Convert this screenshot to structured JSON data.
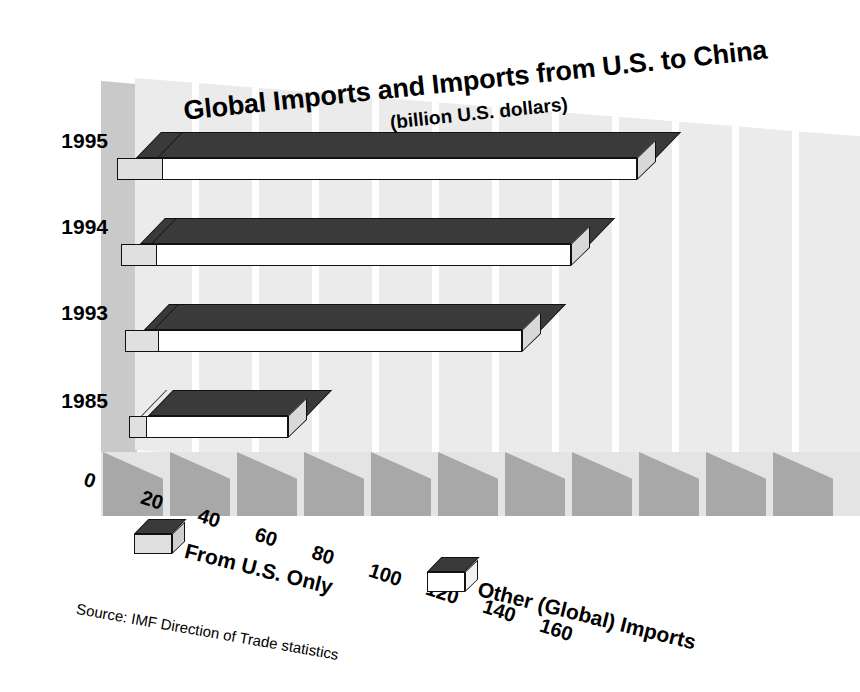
{
  "chart_data": {
    "type": "bar",
    "orientation": "horizontal",
    "stacked": true,
    "style": "3d",
    "title": "Global Imports and Imports from U.S. to China",
    "subtitle": "(billion U.S. dollars)",
    "xlabel": "",
    "ylabel": "",
    "xlim": [
      0,
      160
    ],
    "xticks": [
      0,
      20,
      40,
      60,
      80,
      100,
      120,
      140,
      160
    ],
    "xtick_labels": [
      "0",
      "20",
      "40",
      "60",
      "80",
      "100",
      "120",
      "140",
      "160"
    ],
    "grid": true,
    "legend_position": "bottom",
    "categories": [
      "1995",
      "1994",
      "1993",
      "1985"
    ],
    "series": [
      {
        "name": "From U.S. Only",
        "color": "#e0e0e0",
        "top_color": "#3a3a3a",
        "values": [
          11.7,
          9.3,
          8.8,
          4.7
        ]
      },
      {
        "name": "Other (Global) Imports",
        "color": "#ffffff",
        "top_color": "#3a3a3a",
        "values": [
          120.3,
          106.7,
          95.2,
          37.5
        ]
      }
    ],
    "totals": [
      132.0,
      116.0,
      104.0,
      42.2
    ],
    "source": "Source: IMF Direction of Trade statistics"
  },
  "legend": {
    "items": [
      {
        "label": "From U.S. Only",
        "swatch_name": "legend-swatch-from-us-only"
      },
      {
        "label": "Other (Global) Imports",
        "swatch_name": "legend-swatch-other-global-imports"
      }
    ]
  },
  "colors": {
    "bar_top": "#3a3a3a",
    "bar_front_us": "#e0e0e0",
    "bar_front_other": "#ffffff",
    "back_wall": "#ebebeb",
    "side_wall": "#c9c9c9",
    "floor_tile_dark": "#a8a8a8",
    "floor_base": "#e4e4e4",
    "text": "#000000"
  }
}
